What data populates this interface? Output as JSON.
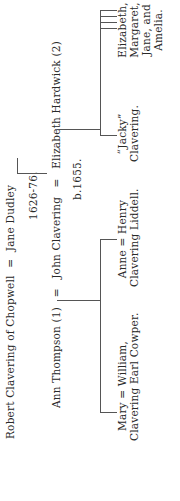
{
  "tree": {
    "generation1": {
      "husband": "Robert Clavering of Chopwell",
      "eq": "=",
      "wife": "Jane Dudley",
      "dates": "1626-76."
    },
    "generation2": {
      "wife1": "Ann Thompson (1)",
      "eq1": "=",
      "husband": "John Clavering",
      "husband_dates": "b.1655.",
      "eq2": "=",
      "wife2": "Elizabeth Hardwick (2)"
    },
    "children_first_marriage": [
      {
        "line1": "Mary = William,",
        "line2": "Clavering Earl Cowper."
      },
      {
        "line1": "Anne = Henry",
        "line2": "Clavering Liddell."
      }
    ],
    "children_second_marriage": [
      {
        "line1": "“Jacky”",
        "line2": "Clavering."
      },
      {
        "line1": "Elizabeth,",
        "line2": "Margaret,",
        "line3": "Jane, and",
        "line4": "Amelia."
      }
    ]
  }
}
